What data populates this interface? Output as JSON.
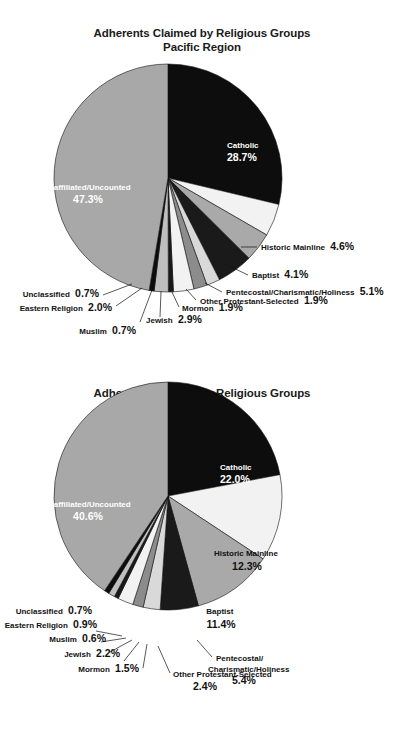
{
  "document": {
    "title": "Adherents Claimed by Religious Groups",
    "background_color": "#ffffff"
  },
  "charts": [
    {
      "id": "pacific",
      "title_line1": "Adherents Claimed by Religious Groups",
      "title_line2": "Pacific Region"
    },
    {
      "id": "national",
      "title_line1": "Adherents Claimed by Religious Groups",
      "title_line2": "National"
    }
  ],
  "chart_data": [
    {
      "type": "pie",
      "id": "pacific",
      "title": "Adherents Claimed by Religious Groups Pacific Region",
      "subtitle": "Pacific Region",
      "xlabel": "",
      "ylabel": "",
      "legend": "none",
      "start_angle_deg": 0,
      "direction": "clockwise",
      "categories": [
        "Catholic",
        "Historic Mainline",
        "Baptist",
        "Pentecostal/Charismatic/Holiness",
        "Other Protestant-Selected",
        "Mormon",
        "Jewish",
        "Muslim",
        "Eastern Religion",
        "Unclassified",
        "Unaffiliated/Uncounted"
      ],
      "values": [
        28.7,
        4.6,
        4.1,
        5.1,
        1.9,
        1.9,
        2.9,
        0.7,
        2.0,
        0.7,
        47.3
      ],
      "value_labels": [
        "28.7%",
        "4.6%",
        "4.1%",
        "5.1%",
        "1.9%",
        "1.9%",
        "2.9%",
        "0.7%",
        "2.0%",
        "0.7%",
        "47.3%"
      ],
      "colors": [
        "#0d0d0d",
        "#f2f2f2",
        "#a9a9a9",
        "#1a1a1a",
        "#d9d9d9",
        "#8c8c8c",
        "#f2f2f2",
        "#1a1a1a",
        "#bfbfbf",
        "#0d0d0d",
        "#a8a8a8"
      ],
      "slices": [
        {
          "name": "Catholic",
          "pct_text": "28.7%",
          "placement": "inside",
          "text_color": "white"
        },
        {
          "name": "Historic Mainline",
          "pct_text": "4.6%",
          "placement": "callout"
        },
        {
          "name": "Baptist",
          "pct_text": "4.1%",
          "placement": "callout"
        },
        {
          "name": "Pentecostal/Charismatic/Holiness",
          "pct_text": "5.1%",
          "placement": "callout"
        },
        {
          "name": "Other Protestant-Selected",
          "pct_text": "1.9%",
          "placement": "callout"
        },
        {
          "name": "Mormon",
          "pct_text": "1.9%",
          "placement": "callout"
        },
        {
          "name": "Jewish",
          "pct_text": "2.9%",
          "placement": "callout"
        },
        {
          "name": "Muslim",
          "pct_text": "0.7%",
          "placement": "callout"
        },
        {
          "name": "Eastern Religion",
          "pct_text": "2.0%",
          "placement": "callout"
        },
        {
          "name": "Unclassified",
          "pct_text": "0.7%",
          "placement": "callout"
        },
        {
          "name": "Unaffiliated/Uncounted",
          "pct_text": "47.3%",
          "placement": "inside",
          "text_color": "white"
        }
      ]
    },
    {
      "type": "pie",
      "id": "national",
      "title": "Adherents Claimed by Religious Groups National",
      "subtitle": "National",
      "xlabel": "",
      "ylabel": "",
      "legend": "none",
      "start_angle_deg": 0,
      "direction": "clockwise",
      "categories": [
        "Catholic",
        "Historic Mainline",
        "Baptist",
        "Pentecostal/Charismatic/Holiness",
        "Other Protestant-Selected",
        "Mormon",
        "Jewish",
        "Muslim",
        "Eastern Religion",
        "Unclassified",
        "Unaffiliated/Uncounted"
      ],
      "values": [
        22.0,
        12.3,
        11.4,
        5.4,
        2.4,
        1.5,
        2.2,
        0.6,
        0.9,
        0.7,
        40.6
      ],
      "value_labels": [
        "22.0%",
        "12.3%",
        "11.4%",
        "5.4%",
        "2.4%",
        "1.5%",
        "2.2%",
        "0.6%",
        "0.9%",
        "0.7%",
        "40.6%"
      ],
      "colors": [
        "#0d0d0d",
        "#f2f2f2",
        "#a9a9a9",
        "#1a1a1a",
        "#d9d9d9",
        "#8c8c8c",
        "#f2f2f2",
        "#1a1a1a",
        "#bfbfbf",
        "#0d0d0d",
        "#a8a8a8"
      ],
      "slices": [
        {
          "name": "Catholic",
          "pct_text": "22.0%",
          "placement": "inside",
          "text_color": "white"
        },
        {
          "name": "Historic Mainline",
          "pct_text": "12.3%",
          "placement": "inside",
          "text_color": "black"
        },
        {
          "name": "Baptist",
          "pct_text": "11.4%",
          "placement": "inside",
          "text_color": "black"
        },
        {
          "name": "Pentecostal/Charismatic/Holiness",
          "pct_text": "5.4%",
          "placement": "callout"
        },
        {
          "name": "Other Protestant-Selected",
          "pct_text": "2.4%",
          "placement": "callout"
        },
        {
          "name": "Mormon",
          "pct_text": "1.5%",
          "placement": "callout"
        },
        {
          "name": "Jewish",
          "pct_text": "2.2%",
          "placement": "callout"
        },
        {
          "name": "Muslim",
          "pct_text": "0.6%",
          "placement": "callout"
        },
        {
          "name": "Eastern Religion",
          "pct_text": "0.9%",
          "placement": "callout"
        },
        {
          "name": "Unclassified",
          "pct_text": "0.7%",
          "placement": "callout"
        },
        {
          "name": "Unaffiliated/Uncounted",
          "pct_text": "40.6%",
          "placement": "inside",
          "text_color": "white"
        }
      ]
    }
  ],
  "labels": {
    "pacific": {
      "catholic_name": "Catholic",
      "catholic_pct": "28.7%",
      "unaffiliated_name": "Unaffiliated/Uncounted",
      "unaffiliated_pct": "47.3%",
      "historic_mainline": "Historic Mainline",
      "historic_mainline_pct": "4.6%",
      "baptist": "Baptist",
      "baptist_pct": "4.1%",
      "pentecostal": "Pentecostal/Charismatic/Holiness",
      "pentecostal_pct": "5.1%",
      "other_protestant": "Other Protestant-Selected",
      "other_protestant_pct": "1.9%",
      "mormon": "Mormon",
      "mormon_pct": "1.9%",
      "jewish": "Jewish",
      "jewish_pct": "2.9%",
      "muslim": "Muslim",
      "muslim_pct": "0.7%",
      "eastern": "Eastern Religion",
      "eastern_pct": "2.0%",
      "unclassified": "Unclassified",
      "unclassified_pct": "0.7%"
    },
    "national": {
      "catholic_name": "Catholic",
      "catholic_pct": "22.0%",
      "unaffiliated_name": "Unaffiliated/Uncounted",
      "unaffiliated_pct": "40.6%",
      "historic_mainline": "Historic Mainline",
      "historic_mainline_pct": "12.3%",
      "baptist": "Baptist",
      "baptist_pct": "11.4%",
      "pentecostal_line1": "Pentecostal/",
      "pentecostal_line2": "Charismatic/Holiness",
      "pentecostal_pct": "5.4%",
      "other_protestant": "Other Protestant-Selected",
      "other_protestant_pct": "2.4%",
      "mormon": "Mormon",
      "mormon_pct": "1.5%",
      "jewish": "Jewish",
      "jewish_pct": "2.2%",
      "muslim": "Muslim",
      "muslim_pct": "0.6%",
      "eastern": "Eastern Religion",
      "eastern_pct": "0.9%",
      "unclassified": "Unclassified",
      "unclassified_pct": "0.7%"
    }
  }
}
